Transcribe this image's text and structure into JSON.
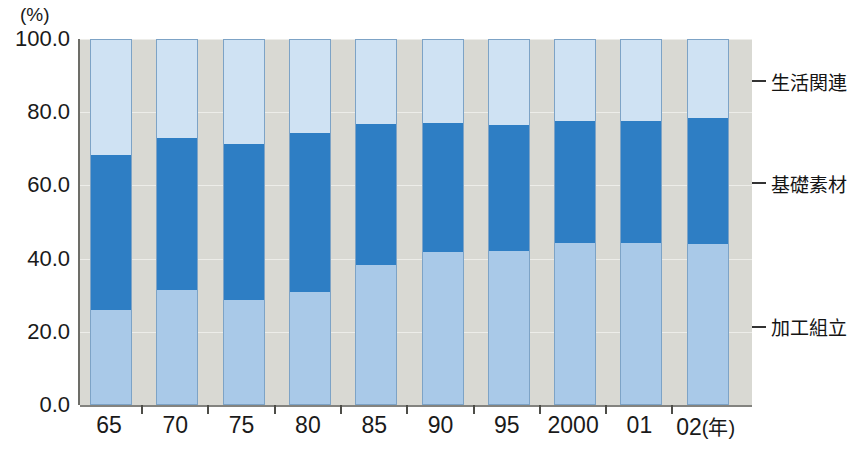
{
  "chart_data": {
    "type": "bar",
    "subtype": "stacked-percent",
    "title": "",
    "unit_label": "(%)",
    "xlabel": "(年)",
    "ylabel": "",
    "ylim": [
      0,
      100
    ],
    "yticks": [
      "0.0",
      "20.0",
      "40.0",
      "60.0",
      "80.0",
      "100.0"
    ],
    "ytick_values": [
      0,
      20,
      40,
      60,
      80,
      100
    ],
    "grid": true,
    "legend_position": "right",
    "categories": [
      "65",
      "70",
      "75",
      "80",
      "85",
      "90",
      "95",
      "2000",
      "01",
      "02"
    ],
    "x_axis_unit": "(年)",
    "series": [
      {
        "name": "加工組立",
        "color": "#a9c9e8",
        "values": [
          26.0,
          31.4,
          28.7,
          30.9,
          38.3,
          41.8,
          42.1,
          44.3,
          44.3,
          44.1
        ]
      },
      {
        "name": "基礎素材",
        "color": "#2e7ec4",
        "values": [
          42.3,
          41.5,
          42.6,
          43.4,
          38.5,
          35.3,
          34.5,
          33.2,
          33.4,
          34.3
        ]
      },
      {
        "name": "生活関連",
        "color": "#cfe2f3",
        "values": [
          31.7,
          27.1,
          28.7,
          25.7,
          23.2,
          22.9,
          23.4,
          22.5,
          22.3,
          21.6
        ]
      }
    ],
    "legend": [
      {
        "label": "生活関連",
        "color": "#cfe2f3"
      },
      {
        "label": "基礎素材",
        "color": "#2e7ec4"
      },
      {
        "label": "加工組立",
        "color": "#a9c9e8"
      }
    ],
    "colors": {
      "plot_background": "#d9d9d3",
      "axis": "#6d6d68",
      "gridline": "#f0f0ec",
      "text": "#1a1a1a"
    }
  }
}
